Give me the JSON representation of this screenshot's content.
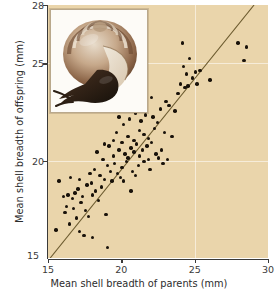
{
  "figure": {
    "background_color": "#ead5ab",
    "point_color": "#19120a",
    "line_color": "#6b5a2e",
    "axis_color": "#3a3a3a",
    "inset_name": "snail-photograph"
  },
  "chart_data": {
    "type": "scatter",
    "title": "",
    "xlabel": "Mean shell breadth of parents (mm)",
    "ylabel": "Mean shell breadth of offspring (mm)",
    "xlim": [
      15,
      30
    ],
    "ylim": [
      15,
      28
    ],
    "xticks": [
      15,
      20,
      25,
      30
    ],
    "yticks": [
      15,
      20,
      25,
      28
    ],
    "xtick_labels": [
      "15",
      "20",
      "25",
      "30"
    ],
    "ytick_labels": [
      "15",
      "20",
      "25",
      "28"
    ],
    "grid": true,
    "gridlines_x": [
      25
    ],
    "gridlines_y": [
      20,
      25
    ],
    "legend": null,
    "annotations": [],
    "trendline": {
      "type": "line",
      "label": "regression line",
      "x": [
        15.15,
        29.05
      ],
      "y": [
        15.0,
        28.0
      ]
    },
    "series": [
      {
        "name": "parent-offspring shell breadth",
        "marker": "circle",
        "points": [
          [
            15.55,
            16.45
          ],
          [
            15.75,
            18.95
          ],
          [
            16.05,
            18.15
          ],
          [
            16.15,
            17.35
          ],
          [
            16.35,
            18.25
          ],
          [
            16.45,
            16.75
          ],
          [
            16.55,
            19.15
          ],
          [
            16.65,
            18.05
          ],
          [
            16.75,
            17.55
          ],
          [
            16.85,
            18.35
          ],
          [
            16.95,
            17.05
          ],
          [
            17.05,
            18.55
          ],
          [
            17.15,
            16.35
          ],
          [
            17.25,
            17.85
          ],
          [
            17.35,
            18.15
          ],
          [
            17.45,
            16.15
          ],
          [
            17.55,
            17.45
          ],
          [
            17.65,
            18.75
          ],
          [
            17.75,
            17.15
          ],
          [
            17.85,
            19.35
          ],
          [
            17.95,
            18.85
          ],
          [
            18.05,
            16.05
          ],
          [
            18.15,
            19.55
          ],
          [
            18.25,
            18.45
          ],
          [
            18.35,
            20.45
          ],
          [
            18.45,
            17.95
          ],
          [
            18.55,
            19.25
          ],
          [
            18.65,
            18.65
          ],
          [
            18.75,
            20.05
          ],
          [
            18.85,
            19.05
          ],
          [
            18.95,
            17.25
          ],
          [
            19.05,
            19.75
          ],
          [
            19.05,
            15.55
          ],
          [
            19.15,
            20.75
          ],
          [
            19.25,
            19.45
          ],
          [
            19.35,
            18.95
          ],
          [
            19.45,
            20.25
          ],
          [
            19.55,
            19.85
          ],
          [
            19.65,
            21.45
          ],
          [
            19.75,
            19.35
          ],
          [
            19.85,
            20.55
          ],
          [
            19.95,
            19.15
          ],
          [
            20.05,
            20.95
          ],
          [
            20.05,
            19.65
          ],
          [
            20.15,
            21.85
          ],
          [
            20.25,
            20.35
          ],
          [
            20.35,
            19.95
          ],
          [
            20.45,
            21.25
          ],
          [
            20.45,
            20.15
          ],
          [
            20.55,
            22.15
          ],
          [
            20.65,
            20.65
          ],
          [
            20.75,
            19.45
          ],
          [
            20.85,
            21.05
          ],
          [
            20.85,
            20.45
          ],
          [
            20.95,
            22.45
          ],
          [
            21.05,
            20.85
          ],
          [
            21.15,
            19.75
          ],
          [
            21.25,
            21.55
          ],
          [
            21.25,
            20.25
          ],
          [
            21.35,
            22.05
          ],
          [
            21.45,
            20.55
          ],
          [
            21.55,
            21.35
          ],
          [
            21.55,
            19.95
          ],
          [
            21.65,
            22.35
          ],
          [
            21.75,
            20.75
          ],
          [
            21.85,
            21.15
          ],
          [
            21.95,
            19.55
          ],
          [
            22.05,
            20.95
          ],
          [
            22.15,
            22.25
          ],
          [
            22.25,
            21.65
          ],
          [
            22.35,
            20.35
          ],
          [
            22.45,
            21.95
          ],
          [
            22.55,
            20.15
          ],
          [
            22.65,
            22.65
          ],
          [
            22.75,
            20.55
          ],
          [
            22.85,
            19.85
          ],
          [
            22.95,
            21.45
          ],
          [
            23.05,
            23.05
          ],
          [
            23.25,
            22.85
          ],
          [
            23.45,
            21.25
          ],
          [
            23.65,
            22.55
          ],
          [
            23.85,
            23.45
          ],
          [
            24.05,
            23.95
          ],
          [
            24.15,
            26.05
          ],
          [
            24.25,
            24.85
          ],
          [
            24.35,
            23.75
          ],
          [
            24.45,
            24.45
          ],
          [
            24.55,
            23.85
          ],
          [
            24.65,
            25.25
          ],
          [
            24.85,
            24.25
          ],
          [
            25.05,
            24.55
          ],
          [
            25.15,
            23.95
          ],
          [
            25.35,
            24.65
          ],
          [
            26.05,
            24.15
          ],
          [
            27.95,
            26.05
          ],
          [
            28.35,
            25.15
          ],
          [
            28.55,
            25.85
          ],
          [
            17.15,
            19.05
          ],
          [
            18.05,
            18.25
          ],
          [
            19.45,
            21.05
          ],
          [
            20.15,
            18.95
          ],
          [
            20.95,
            19.25
          ],
          [
            21.05,
            22.75
          ],
          [
            22.05,
            23.25
          ],
          [
            16.25,
            17.65
          ],
          [
            18.85,
            20.85
          ],
          [
            19.85,
            22.25
          ],
          [
            20.65,
            18.45
          ],
          [
            21.85,
            20.05
          ],
          [
            23.15,
            20.05
          ]
        ]
      }
    ]
  }
}
